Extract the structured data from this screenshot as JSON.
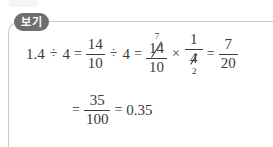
{
  "document": {
    "type": "math-worked-example",
    "language": "ko",
    "background_color": "#ffffff",
    "ink_color": "#3a3a3a",
    "rule_color": "#c9c9c9"
  },
  "badge": {
    "label": "보기",
    "background_color": "#6e6e6e",
    "text_color": "#ffffff"
  },
  "equation": {
    "line1": {
      "start_value": "1.4",
      "divide_op": "÷",
      "divisor": "4",
      "eq1": "=",
      "frac1": {
        "numerator": "14",
        "denominator": "10"
      },
      "divide_op2": "÷",
      "divisor2": "4",
      "eq2": "=",
      "frac2": {
        "numerator": "14",
        "numerator_cancelled_to": "7",
        "denominator": "10"
      },
      "times_op": "×",
      "frac3": {
        "numerator": "1",
        "denominator": "4",
        "denominator_cancelled_to": "2"
      },
      "eq3": "=",
      "frac4": {
        "numerator": "7",
        "denominator": "20"
      }
    },
    "line2": {
      "eq1": "=",
      "frac1": {
        "numerator": "35",
        "denominator": "100"
      },
      "eq2": "=",
      "result": "0.35"
    }
  }
}
